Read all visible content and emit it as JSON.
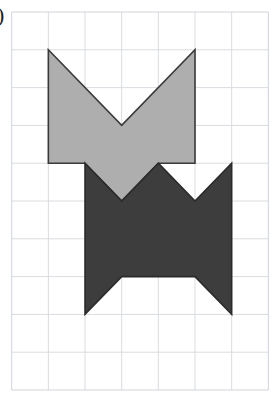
{
  "page": {
    "width": 278,
    "height": 406,
    "background": "#ffffff",
    "label": ")"
  },
  "grid": {
    "name": "square-grid",
    "origin_x": 11.7,
    "origin_y": 12.0,
    "cell_width": 36.66,
    "cell_height": 37.8,
    "cols": 7,
    "rows": 10,
    "line_color": "#d9dce0",
    "line_width": 1,
    "border_color": "#cfd3d8"
  },
  "shapes": [
    {
      "name": "light-gray-arrow-shape",
      "fill": "#aeaeae",
      "stroke": "#3a3a3a",
      "stroke_width": 1.6,
      "grid_points": [
        [
          1,
          1
        ],
        [
          3,
          3
        ],
        [
          5,
          1
        ],
        [
          5,
          4
        ],
        [
          4,
          4
        ],
        [
          3,
          5
        ],
        [
          2,
          4
        ],
        [
          1,
          4
        ]
      ]
    },
    {
      "name": "dark-gray-double-arrow-shape",
      "fill": "#3d3d3d",
      "stroke": "#2b2b2b",
      "stroke_width": 1.6,
      "grid_points": [
        [
          2,
          4
        ],
        [
          3,
          5
        ],
        [
          4,
          4
        ],
        [
          5,
          5
        ],
        [
          6,
          4
        ],
        [
          6,
          8
        ],
        [
          5,
          7
        ],
        [
          3,
          7
        ],
        [
          2,
          8
        ]
      ]
    }
  ]
}
